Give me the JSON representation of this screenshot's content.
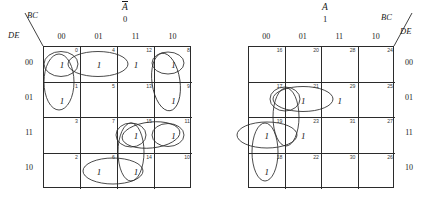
{
  "figure": {
    "type": "karnaugh-map-pair",
    "variables": [
      "A",
      "B",
      "C",
      "D",
      "E"
    ],
    "column_variable_label": "BC",
    "row_variable_label": "DE",
    "column_headers": [
      "00",
      "01",
      "11",
      "10"
    ],
    "row_headers": [
      "00",
      "01",
      "11",
      "10"
    ]
  },
  "maps": [
    {
      "id": "left",
      "select_variable": "A",
      "select_overbar": true,
      "select_value": "0",
      "corner_top_label": "BC",
      "corner_bottom_label": "DE",
      "column_headers": [
        "00",
        "01",
        "11",
        "10"
      ],
      "row_headers": [
        "00",
        "01",
        "11",
        "10"
      ],
      "cells": [
        [
          {
            "minterm": "0",
            "value": "1"
          },
          {
            "minterm": "4",
            "value": "1"
          },
          {
            "minterm": "12",
            "value": "1"
          },
          {
            "minterm": "8",
            "value": "1"
          }
        ],
        [
          {
            "minterm": "1",
            "value": "1"
          },
          {
            "minterm": "5",
            "value": ""
          },
          {
            "minterm": "13",
            "value": ""
          },
          {
            "minterm": "9",
            "value": "1"
          }
        ],
        [
          {
            "minterm": "3",
            "value": ""
          },
          {
            "minterm": "7",
            "value": ""
          },
          {
            "minterm": "15",
            "value": "1"
          },
          {
            "minterm": "11",
            "value": "1"
          }
        ],
        [
          {
            "minterm": "2",
            "value": ""
          },
          {
            "minterm": "6",
            "value": "1"
          },
          {
            "minterm": "14",
            "value": "1"
          },
          {
            "minterm": "10",
            "value": ""
          }
        ]
      ]
    },
    {
      "id": "right",
      "select_variable": "A",
      "select_overbar": false,
      "select_value": "1",
      "corner_top_label": "BC",
      "corner_bottom_label": "DE",
      "column_headers": [
        "00",
        "01",
        "11",
        "10"
      ],
      "row_headers": [
        "00",
        "01",
        "11",
        "10"
      ],
      "cells": [
        [
          {
            "minterm": "16",
            "value": ""
          },
          {
            "minterm": "20",
            "value": ""
          },
          {
            "minterm": "28",
            "value": ""
          },
          {
            "minterm": "24",
            "value": ""
          }
        ],
        [
          {
            "minterm": "17",
            "value": ""
          },
          {
            "minterm": "21",
            "value": "1"
          },
          {
            "minterm": "29",
            "value": "1"
          },
          {
            "minterm": "25",
            "value": ""
          }
        ],
        [
          {
            "minterm": "19",
            "value": "1"
          },
          {
            "minterm": "23",
            "value": "1"
          },
          {
            "minterm": "31",
            "value": ""
          },
          {
            "minterm": "27",
            "value": ""
          }
        ],
        [
          {
            "minterm": "18",
            "value": "1"
          },
          {
            "minterm": "22",
            "value": ""
          },
          {
            "minterm": "30",
            "value": ""
          },
          {
            "minterm": "26",
            "value": ""
          }
        ]
      ]
    }
  ],
  "colors": {
    "ink": "#2b2b2b",
    "background": "#ffffff",
    "minterm_label": "#3a3a3a"
  }
}
